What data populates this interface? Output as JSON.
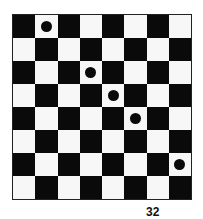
{
  "board": {
    "rows": 8,
    "cols": 8,
    "top_left_color": "black",
    "colors": {
      "black": "#0a0a0a",
      "white": "#f7f7f7"
    },
    "discs": [
      {
        "row": 0,
        "col": 1
      },
      {
        "row": 2,
        "col": 3
      },
      {
        "row": 3,
        "col": 4
      },
      {
        "row": 4,
        "col": 5
      },
      {
        "row": 6,
        "col": 7
      }
    ]
  },
  "page_label": "32"
}
